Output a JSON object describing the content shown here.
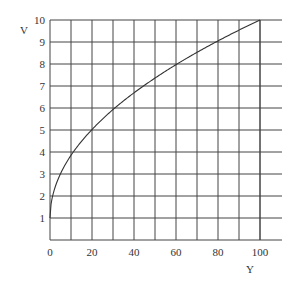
{
  "chart_data": {
    "type": "line",
    "title": "",
    "xlabel": "Y",
    "ylabel": "V",
    "xlim": [
      0,
      100
    ],
    "ylim": [
      0,
      10
    ],
    "x_ticks": [
      0,
      20,
      40,
      60,
      80,
      100
    ],
    "y_ticks": [
      1,
      2,
      3,
      4,
      5,
      6,
      7,
      8,
      9,
      10
    ],
    "grid": true,
    "x_grid_step": 10,
    "y_grid_step": 1,
    "series": [
      {
        "name": "V",
        "x": [
          0,
          2,
          5,
          10,
          20,
          30,
          40,
          50,
          60,
          70,
          80,
          90,
          100
        ],
        "values": [
          1.0,
          2.27,
          3.01,
          3.85,
          5.02,
          5.93,
          6.69,
          7.36,
          7.97,
          8.53,
          9.05,
          9.54,
          10.0
        ]
      }
    ],
    "legend": null
  },
  "labels": {
    "y_axis": "V",
    "x_axis": "Y"
  }
}
